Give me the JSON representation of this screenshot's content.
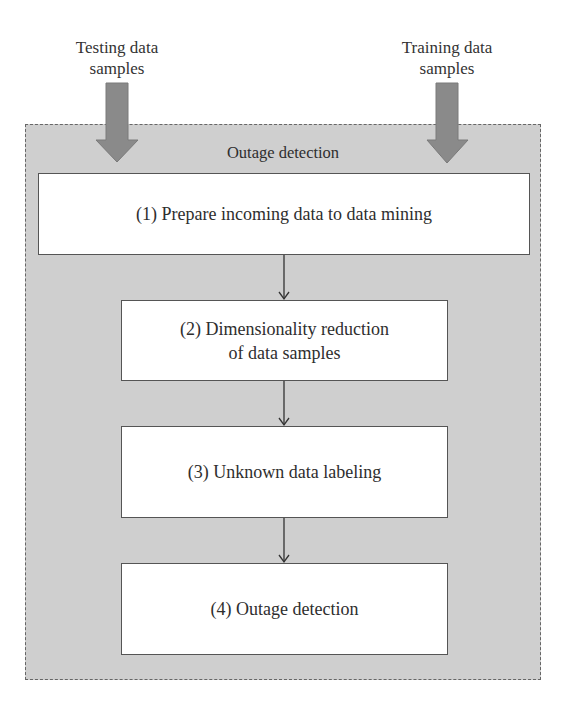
{
  "inputs": {
    "testing": "Testing data\nsamples",
    "training": "Training data\nsamples"
  },
  "container": {
    "title": "Outage detection"
  },
  "steps": [
    {
      "label": "(1) Prepare incoming data to data mining"
    },
    {
      "label": "(2) Dimensionality reduction\nof data samples"
    },
    {
      "label": "(3) Unknown data labeling"
    },
    {
      "label": "(4) Outage detection"
    }
  ],
  "colors": {
    "container_fill": "#cfcfcf",
    "arrow_fill": "#8a8a8a",
    "box_fill": "#ffffff",
    "border": "#555555"
  }
}
